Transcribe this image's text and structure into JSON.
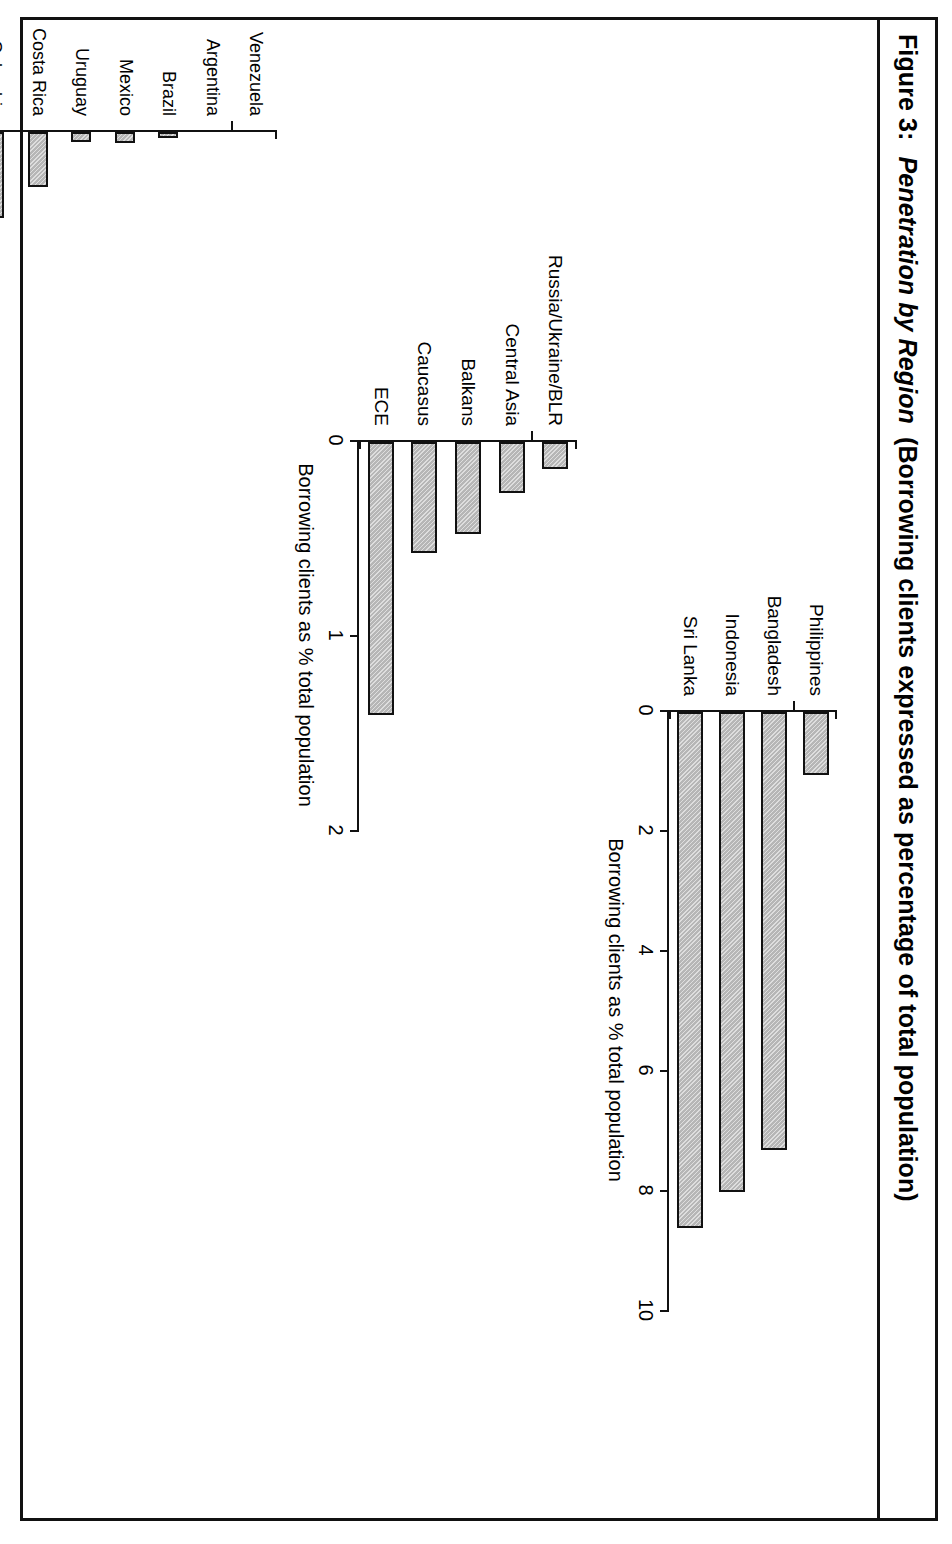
{
  "figure": {
    "label": "Figure 3:",
    "title_italic": "Penetration by Region",
    "title_rest": "(Borrowing clients expressed as percentage of total population)",
    "full_title": "Figure 3:  Penetration by Region (Borrowing clients expressed as percentage of total population)"
  },
  "chart_data": [
    {
      "id": "asia",
      "type": "bar",
      "orientation": "vertical",
      "title": "",
      "xlabel": "",
      "ylabel": "Borrowing clients as % total population",
      "ylim": [
        0,
        10
      ],
      "yticks": [
        0,
        2,
        4,
        6,
        8,
        10
      ],
      "ticklabels": [
        "0",
        "2",
        "4",
        "6",
        "8",
        "10"
      ],
      "grid": false,
      "legend": "none",
      "categories": [
        "Philippines",
        "Bangladesh",
        "Indonesia",
        "Sri Lanka"
      ],
      "values": [
        1.05,
        7.3,
        8.0,
        8.6
      ]
    },
    {
      "id": "eca",
      "type": "bar",
      "orientation": "vertical",
      "title": "",
      "xlabel": "",
      "ylabel": "Borrowing clients as % total population",
      "ylim": [
        0,
        2
      ],
      "yticks": [
        0,
        1,
        2
      ],
      "ticklabels": [
        "0",
        "1",
        "2"
      ],
      "grid": false,
      "legend": "none",
      "categories": [
        "Russia/Ukraine/BLR",
        "Central Asia",
        "Balkans",
        "Caucasus",
        "ECE"
      ],
      "values": [
        0.14,
        0.26,
        0.47,
        0.57,
        1.4
      ]
    },
    {
      "id": "lac",
      "type": "bar",
      "orientation": "vertical",
      "title": "",
      "xlabel": "",
      "ylabel": "Borrowing clients as % total population",
      "ylim": [
        0,
        5
      ],
      "yticks": [
        0,
        1,
        2,
        3,
        4,
        5
      ],
      "ticklabels": [
        "0",
        "1",
        "2",
        "3",
        "4",
        "5"
      ],
      "grid": false,
      "legend": "none",
      "categories": [
        "Venezuela",
        "Argentina",
        "Brazil",
        "Mexico",
        "Uruguay",
        "Costa Rica",
        "Colombia",
        "Paraguay",
        "Ecuador",
        "Chile",
        "Dominican Rep",
        "Guatemala",
        "Peru",
        "El Salvador",
        "Honduras",
        "Nicaragua",
        "Bolivia"
      ],
      "values": [
        0.0,
        0.0,
        0.04,
        0.08,
        0.07,
        0.38,
        0.6,
        0.59,
        0.6,
        0.62,
        0.64,
        0.67,
        0.78,
        1.3,
        1.5,
        1.65,
        4.2
      ]
    }
  ]
}
